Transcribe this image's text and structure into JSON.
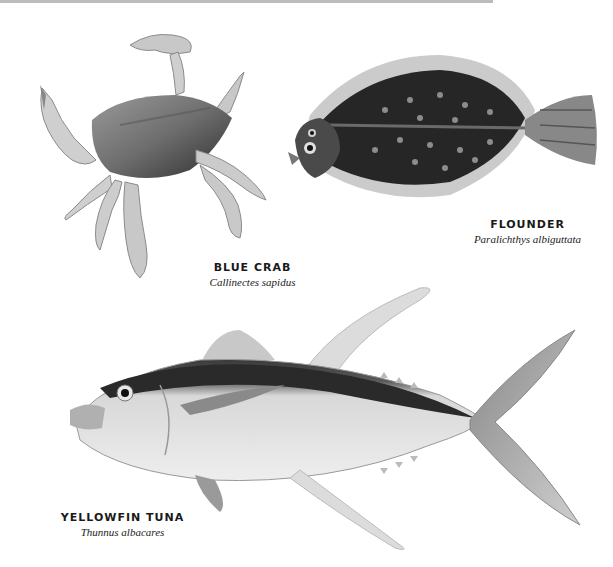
{
  "species": [
    {
      "id": "blue-crab",
      "common_name": "BLUE CRAB",
      "scientific_name": "Callinectes sapidus"
    },
    {
      "id": "flounder",
      "common_name": "FLOUNDER",
      "scientific_name": "Paralichthys albiguttata"
    },
    {
      "id": "yellowfin-tuna",
      "common_name": "YELLOWFIN TUNA",
      "scientific_name": "Thunnus albacares"
    }
  ],
  "colors": {
    "background": "#ffffff",
    "ink": "#1a1a1a",
    "top_rule": "#bcbcbc"
  }
}
